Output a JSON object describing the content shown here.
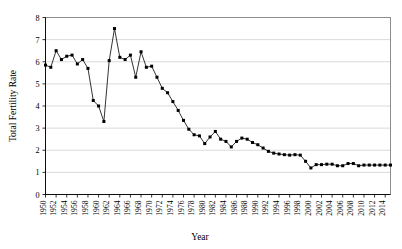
{
  "chart_data": {
    "type": "line",
    "title": "",
    "xlabel": "Year",
    "ylabel": "Total Fertility Rate",
    "ylim": [
      0,
      8
    ],
    "xlim": [
      1950,
      2015
    ],
    "grid": true,
    "legend": false,
    "marker": "square",
    "y_ticks": [
      "0",
      "1",
      "2",
      "3",
      "4",
      "5",
      "6",
      "7",
      "8"
    ],
    "x_ticks": [
      "1950",
      "1952",
      "1954",
      "1956",
      "1958",
      "1960",
      "1962",
      "1964",
      "1966",
      "1968",
      "1970",
      "1972",
      "1974",
      "1976",
      "1978",
      "1980",
      "1982",
      "1984",
      "1986",
      "1988",
      "1990",
      "1992",
      "1994",
      "1996",
      "1998",
      "2000",
      "2002",
      "2004",
      "2006",
      "2008",
      "2010",
      "2012",
      "2014"
    ],
    "x": [
      1950,
      1951,
      1952,
      1953,
      1954,
      1955,
      1956,
      1957,
      1958,
      1959,
      1960,
      1961,
      1962,
      1963,
      1964,
      1965,
      1966,
      1967,
      1968,
      1969,
      1970,
      1971,
      1972,
      1973,
      1974,
      1975,
      1976,
      1977,
      1978,
      1979,
      1980,
      1981,
      1982,
      1983,
      1984,
      1985,
      1986,
      1987,
      1988,
      1989,
      1990,
      1991,
      1992,
      1993,
      1994,
      1995,
      1996,
      1997,
      1998,
      1999,
      2000,
      2001,
      2002,
      2003,
      2004,
      2005,
      2006,
      2007,
      2008,
      2009,
      2010,
      2011,
      2012,
      2013,
      2014,
      2015
    ],
    "values": [
      5.85,
      5.75,
      6.5,
      6.1,
      6.25,
      6.3,
      5.9,
      6.1,
      5.7,
      4.25,
      4.0,
      3.3,
      6.05,
      7.5,
      6.2,
      6.1,
      6.3,
      5.3,
      6.45,
      5.75,
      5.8,
      5.3,
      4.8,
      4.6,
      4.2,
      3.8,
      3.35,
      2.95,
      2.7,
      2.65,
      2.3,
      2.6,
      2.85,
      2.5,
      2.4,
      2.15,
      2.4,
      2.55,
      2.5,
      2.35,
      2.25,
      2.1,
      1.95,
      1.87,
      1.83,
      1.8,
      1.78,
      1.8,
      1.78,
      1.5,
      1.2,
      1.35,
      1.35,
      1.37,
      1.37,
      1.3,
      1.3,
      1.4,
      1.4,
      1.3,
      1.33,
      1.33,
      1.33,
      1.33,
      1.33,
      1.33
    ],
    "axes": {
      "y_min": 0,
      "y_max": 8,
      "y_step": 1,
      "x_min": 1950,
      "x_max": 2015,
      "x_label_step": 2
    }
  }
}
